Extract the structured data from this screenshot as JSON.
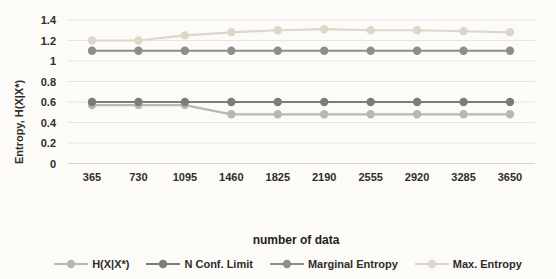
{
  "colors": {
    "background": "#fcfbf7",
    "gridline": "#e8e5de",
    "axis_line": "#d8d5cd",
    "text": "#2e2d2b"
  },
  "chart_data": {
    "type": "line",
    "title": "",
    "xlabel": "number of data",
    "ylabel": "Entropy, H(X|X*)",
    "categories": [
      "365",
      "730",
      "1095",
      "1460",
      "1825",
      "2190",
      "2555",
      "2920",
      "3285",
      "3650"
    ],
    "y_ticks": [
      "0",
      "0.2",
      "0.4",
      "0.6",
      "0.8",
      "1",
      "1.2",
      "1.4"
    ],
    "ylim": [
      0,
      1.4
    ],
    "grid": true,
    "legend_position": "bottom",
    "series": [
      {
        "id": "h_xix",
        "name": "H(X|X*)",
        "color": "#b9b7b2",
        "values": [
          0.57,
          0.57,
          0.57,
          0.48,
          0.48,
          0.48,
          0.48,
          0.48,
          0.48,
          0.48
        ]
      },
      {
        "id": "n_conf_limit",
        "name": "N Conf. Limit",
        "color": "#7e7c78",
        "values": [
          0.6,
          0.6,
          0.6,
          0.6,
          0.6,
          0.6,
          0.6,
          0.6,
          0.6,
          0.6
        ]
      },
      {
        "id": "marginal_entropy",
        "name": "Marginal Entropy",
        "color": "#8f8d89",
        "values": [
          1.1,
          1.1,
          1.1,
          1.1,
          1.1,
          1.1,
          1.1,
          1.1,
          1.1,
          1.1
        ]
      },
      {
        "id": "max_entropy",
        "name": "Max. Entropy",
        "color": "#dcd8c9",
        "values": [
          1.2,
          1.2,
          1.25,
          1.28,
          1.3,
          1.31,
          1.3,
          1.3,
          1.29,
          1.28
        ]
      }
    ]
  }
}
